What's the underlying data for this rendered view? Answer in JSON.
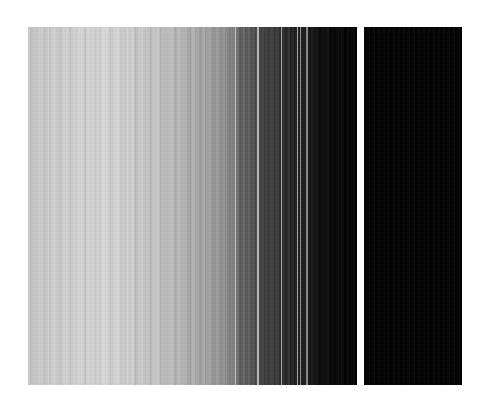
{
  "figure": {
    "title": "",
    "background_color": "#ffffff",
    "width": 485,
    "height": 408
  },
  "chart_data": {
    "type": "heatmap",
    "title": "",
    "subtitle": "",
    "xlabel": "",
    "ylabel": "",
    "orientation": "vertical-stripes",
    "colormap": "grayscale",
    "value_range": [
      0,
      255
    ],
    "grid": false,
    "legend": null,
    "axis_ticks": [],
    "tick_labels": [],
    "annotations": [],
    "panels": [
      {
        "name": "main-panel",
        "x": 28,
        "y": 27,
        "width": 329,
        "height": 358,
        "description": "Wide grayscale stripe panel, monotonically darkening left to right with thin bright separator stripes.",
        "columns": [
          {
            "x": 0.0,
            "w": 1.2,
            "gray": 196
          },
          {
            "x": 1.2,
            "w": 1.8,
            "gray": 203
          },
          {
            "x": 3.0,
            "w": 2.4,
            "gray": 199
          },
          {
            "x": 5.4,
            "w": 3.0,
            "gray": 205
          },
          {
            "x": 8.4,
            "w": 2.1,
            "gray": 198
          },
          {
            "x": 10.5,
            "w": 3.6,
            "gray": 206
          },
          {
            "x": 14.1,
            "w": 2.4,
            "gray": 201
          },
          {
            "x": 16.5,
            "w": 4.2,
            "gray": 208
          },
          {
            "x": 20.7,
            "w": 1.5,
            "gray": 194
          },
          {
            "x": 22.2,
            "w": 3.3,
            "gray": 204
          },
          {
            "x": 25.5,
            "w": 2.7,
            "gray": 210
          },
          {
            "x": 28.2,
            "w": 4.8,
            "gray": 206
          },
          {
            "x": 33.0,
            "w": 1.8,
            "gray": 199
          },
          {
            "x": 34.8,
            "w": 5.4,
            "gray": 209
          },
          {
            "x": 40.2,
            "w": 3.0,
            "gray": 203
          },
          {
            "x": 43.2,
            "w": 4.5,
            "gray": 212
          },
          {
            "x": 47.7,
            "w": 2.1,
            "gray": 205
          },
          {
            "x": 49.8,
            "w": 6.0,
            "gray": 214
          },
          {
            "x": 55.8,
            "w": 2.4,
            "gray": 207
          },
          {
            "x": 58.2,
            "w": 5.1,
            "gray": 213
          },
          {
            "x": 63.3,
            "w": 3.3,
            "gray": 209
          },
          {
            "x": 66.6,
            "w": 4.2,
            "gray": 215
          },
          {
            "x": 70.8,
            "w": 2.7,
            "gray": 210
          },
          {
            "x": 73.5,
            "w": 6.3,
            "gray": 216
          },
          {
            "x": 79.8,
            "w": 3.9,
            "gray": 211
          },
          {
            "x": 83.7,
            "w": 2.4,
            "gray": 205
          },
          {
            "x": 86.1,
            "w": 4.8,
            "gray": 213
          },
          {
            "x": 90.9,
            "w": 3.0,
            "gray": 207
          },
          {
            "x": 93.9,
            "w": 5.7,
            "gray": 211
          },
          {
            "x": 99.6,
            "w": 2.1,
            "gray": 201
          },
          {
            "x": 101.7,
            "w": 4.5,
            "gray": 206
          },
          {
            "x": 106.2,
            "w": 3.6,
            "gray": 199
          },
          {
            "x": 109.8,
            "w": 5.1,
            "gray": 204
          },
          {
            "x": 114.9,
            "w": 2.7,
            "gray": 196
          },
          {
            "x": 117.6,
            "w": 4.2,
            "gray": 201
          },
          {
            "x": 121.8,
            "w": 3.3,
            "gray": 194
          },
          {
            "x": 125.1,
            "w": 5.4,
            "gray": 198
          },
          {
            "x": 130.5,
            "w": 2.4,
            "gray": 188
          },
          {
            "x": 132.9,
            "w": 4.8,
            "gray": 193
          },
          {
            "x": 137.7,
            "w": 3.0,
            "gray": 185
          },
          {
            "x": 140.7,
            "w": 5.7,
            "gray": 190
          },
          {
            "x": 146.4,
            "w": 2.7,
            "gray": 181
          },
          {
            "x": 149.1,
            "w": 4.2,
            "gray": 186
          },
          {
            "x": 153.3,
            "w": 3.6,
            "gray": 176
          },
          {
            "x": 156.9,
            "w": 2.1,
            "gray": 183
          },
          {
            "x": 159.0,
            "w": 4.5,
            "gray": 172
          },
          {
            "x": 163.5,
            "w": 3.3,
            "gray": 178
          },
          {
            "x": 166.8,
            "w": 2.4,
            "gray": 168
          },
          {
            "x": 169.2,
            "w": 5.1,
            "gray": 164
          },
          {
            "x": 174.3,
            "w": 2.7,
            "gray": 171
          },
          {
            "x": 177.0,
            "w": 3.9,
            "gray": 158
          },
          {
            "x": 180.9,
            "w": 2.1,
            "gray": 165
          },
          {
            "x": 183.0,
            "w": 4.2,
            "gray": 152
          },
          {
            "x": 187.2,
            "w": 2.4,
            "gray": 159
          },
          {
            "x": 189.6,
            "w": 3.6,
            "gray": 146
          },
          {
            "x": 193.2,
            "w": 2.7,
            "gray": 141
          },
          {
            "x": 195.9,
            "w": 3.0,
            "gray": 148
          },
          {
            "x": 198.9,
            "w": 2.1,
            "gray": 136
          },
          {
            "x": 201.0,
            "w": 3.3,
            "gray": 130
          },
          {
            "x": 204.3,
            "w": 2.4,
            "gray": 124
          },
          {
            "x": 206.7,
            "w": 1.5,
            "gray": 198
          },
          {
            "x": 208.2,
            "w": 2.7,
            "gray": 110
          },
          {
            "x": 210.9,
            "w": 3.6,
            "gray": 96
          },
          {
            "x": 214.5,
            "w": 2.1,
            "gray": 104
          },
          {
            "x": 216.6,
            "w": 3.0,
            "gray": 88
          },
          {
            "x": 219.6,
            "w": 2.4,
            "gray": 95
          },
          {
            "x": 222.0,
            "w": 1.8,
            "gray": 80
          },
          {
            "x": 223.8,
            "w": 3.3,
            "gray": 86
          },
          {
            "x": 227.1,
            "w": 2.1,
            "gray": 74
          },
          {
            "x": 229.2,
            "w": 1.5,
            "gray": 180
          },
          {
            "x": 230.7,
            "w": 2.7,
            "gray": 68
          },
          {
            "x": 233.4,
            "w": 3.6,
            "gray": 62
          },
          {
            "x": 237.0,
            "w": 2.4,
            "gray": 70
          },
          {
            "x": 239.4,
            "w": 3.0,
            "gray": 57
          },
          {
            "x": 242.4,
            "w": 2.1,
            "gray": 64
          },
          {
            "x": 244.5,
            "w": 3.3,
            "gray": 52
          },
          {
            "x": 247.8,
            "w": 2.7,
            "gray": 58
          },
          {
            "x": 250.5,
            "w": 2.1,
            "gray": 46
          },
          {
            "x": 252.6,
            "w": 1.5,
            "gray": 172
          },
          {
            "x": 254.1,
            "w": 2.4,
            "gray": 42
          },
          {
            "x": 256.5,
            "w": 3.0,
            "gray": 36
          },
          {
            "x": 259.5,
            "w": 2.1,
            "gray": 44
          },
          {
            "x": 261.6,
            "w": 2.7,
            "gray": 32
          },
          {
            "x": 264.3,
            "w": 1.8,
            "gray": 38
          },
          {
            "x": 266.1,
            "w": 2.4,
            "gray": 28
          },
          {
            "x": 268.5,
            "w": 1.5,
            "gray": 166
          },
          {
            "x": 270.0,
            "w": 2.1,
            "gray": 25
          },
          {
            "x": 272.1,
            "w": 1.2,
            "gray": 150
          },
          {
            "x": 273.3,
            "w": 2.7,
            "gray": 22
          },
          {
            "x": 276.0,
            "w": 2.1,
            "gray": 30
          },
          {
            "x": 278.1,
            "w": 1.5,
            "gray": 140
          },
          {
            "x": 279.6,
            "w": 3.0,
            "gray": 18
          },
          {
            "x": 282.6,
            "w": 2.4,
            "gray": 24
          },
          {
            "x": 285.0,
            "w": 3.3,
            "gray": 14
          },
          {
            "x": 288.3,
            "w": 2.1,
            "gray": 20
          },
          {
            "x": 290.4,
            "w": 2.7,
            "gray": 11
          },
          {
            "x": 293.1,
            "w": 3.6,
            "gray": 9
          },
          {
            "x": 296.7,
            "w": 2.4,
            "gray": 13
          },
          {
            "x": 299.1,
            "w": 4.2,
            "gray": 7
          },
          {
            "x": 303.3,
            "w": 3.0,
            "gray": 5
          },
          {
            "x": 306.3,
            "w": 5.4,
            "gray": 4
          },
          {
            "x": 311.7,
            "w": 3.6,
            "gray": 3
          },
          {
            "x": 315.3,
            "w": 6.0,
            "gray": 2
          },
          {
            "x": 321.3,
            "w": 7.7,
            "gray": 1
          }
        ]
      },
      {
        "name": "right-panel",
        "x": 364,
        "y": 27,
        "width": 98,
        "height": 358,
        "description": "Narrow solid near-black panel separated from the main panel by a white vertical gap.",
        "columns": [
          {
            "x": 0.0,
            "w": 98.0,
            "gray": 2
          }
        ]
      }
    ],
    "separator": {
      "name": "panel-gap",
      "x": 357,
      "width": 7,
      "color": "#ffffff"
    }
  }
}
